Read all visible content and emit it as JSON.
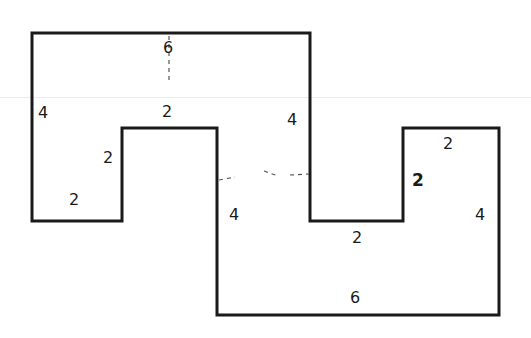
{
  "diagram": {
    "type": "rectilinear-polygon",
    "stroke_color": "#1a1a1a",
    "background": "#ffffff",
    "vertices": [
      [
        32,
        33
      ],
      [
        310,
        33
      ],
      [
        310,
        221
      ],
      [
        403,
        221
      ],
      [
        403,
        128
      ],
      [
        499,
        128
      ],
      [
        499,
        315
      ],
      [
        217,
        315
      ],
      [
        217,
        128
      ],
      [
        122,
        128
      ],
      [
        122,
        221
      ],
      [
        32,
        221
      ]
    ],
    "labels": [
      {
        "id": "top",
        "text": "6",
        "x": 168,
        "y": 48,
        "bold": false
      },
      {
        "id": "left-outer",
        "text": "4",
        "x": 43,
        "y": 113,
        "bold": false
      },
      {
        "id": "notch-top",
        "text": "2",
        "x": 167,
        "y": 112,
        "bold": false
      },
      {
        "id": "notch-left",
        "text": "2",
        "x": 108,
        "y": 158,
        "bold": false
      },
      {
        "id": "bottom-left",
        "text": "2",
        "x": 74,
        "y": 200,
        "bold": false
      },
      {
        "id": "middle-right-upper",
        "text": "4",
        "x": 292,
        "y": 120,
        "bold": false
      },
      {
        "id": "middle-left-lower",
        "text": "4",
        "x": 234,
        "y": 215,
        "bold": false
      },
      {
        "id": "right-top",
        "text": "2",
        "x": 448,
        "y": 144,
        "bold": false
      },
      {
        "id": "right-notch-side",
        "text": "2",
        "x": 418,
        "y": 180,
        "bold": true
      },
      {
        "id": "right-outer",
        "text": "4",
        "x": 480,
        "y": 215,
        "bold": false
      },
      {
        "id": "right-notch-bottom",
        "text": "2",
        "x": 357,
        "y": 238,
        "bold": false
      },
      {
        "id": "bottom",
        "text": "6",
        "x": 355,
        "y": 298,
        "bold": false
      }
    ],
    "dashed_lines": [
      {
        "x1": 169,
        "y1": 36,
        "x2": 169,
        "y2": 82
      },
      {
        "x1": 219,
        "y1": 180,
        "x2": 235,
        "y2": 177
      },
      {
        "x1": 264,
        "y1": 171,
        "x2": 278,
        "y2": 176
      },
      {
        "x1": 290,
        "y1": 175,
        "x2": 309,
        "y2": 174
      }
    ]
  }
}
